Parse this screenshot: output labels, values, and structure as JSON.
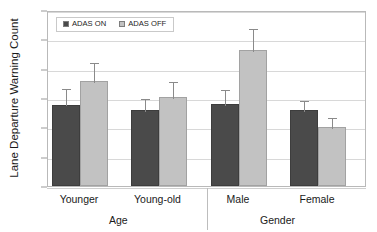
{
  "chart_data": {
    "type": "bar",
    "title": "",
    "xlabel": "",
    "ylabel": "Lane Departure Warning Count",
    "ylim": [
      0.0,
      3.0
    ],
    "ytick_labels": [
      "0.0",
      "0.5",
      "1.0",
      "1.5",
      "2.0",
      "2.5",
      "3.0"
    ],
    "ytick_values": [
      0.0,
      0.5,
      1.0,
      1.5,
      2.0,
      2.5,
      3.0
    ],
    "grid": true,
    "legend_position": "top-left",
    "categories": [
      "Younger",
      "Young-old",
      "Male",
      "Female"
    ],
    "group_labels": [
      "Age",
      "Gender"
    ],
    "group_spans": [
      [
        "Younger",
        "Young-old"
      ],
      [
        "Male",
        "Female"
      ]
    ],
    "series": [
      {
        "name": "ADAS ON",
        "color": "#4a4a4a",
        "values": [
          1.39,
          1.29,
          1.4,
          1.3
        ],
        "errors": [
          0.3,
          0.22,
          0.27,
          0.18
        ]
      },
      {
        "name": "ADAS OFF",
        "color": "#c2c2c2",
        "values": [
          1.79,
          1.51,
          2.32,
          1.01
        ],
        "errors": [
          0.34,
          0.3,
          0.39,
          0.19
        ]
      }
    ]
  },
  "legend": {
    "items": [
      {
        "label": "ADAS ON",
        "swatch": "dark-square-swatch"
      },
      {
        "label": "ADAS OFF",
        "swatch": "light-square-swatch"
      }
    ]
  },
  "axes": {
    "y_title": "Lane Departure Warning Count",
    "y_ticks": [
      "3.0",
      "2.5",
      "2.0",
      "1.5",
      "1.0",
      "0.5",
      "0.0"
    ]
  },
  "colors": {
    "series_on": "#4a4a4a",
    "series_off": "#c2c2c2",
    "grid": "#d8d8d8",
    "frame": "#b9b9b9",
    "error_bar": "#8a8a8a",
    "text": "#1a1a1a",
    "background": "#ffffff"
  }
}
